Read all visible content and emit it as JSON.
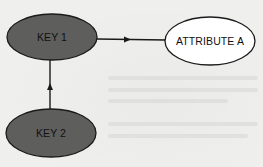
{
  "diagram": {
    "type": "entity-dependency",
    "colors": {
      "background": "#efefed",
      "key_fill": "#5e5e5c",
      "key_text": "#111111",
      "attribute_fill": "#ffffff",
      "stroke": "#1a1a1a"
    },
    "nodes": [
      {
        "id": "key1",
        "label": "KEY 1",
        "kind": "key",
        "cx": 52,
        "cy": 37,
        "rx": 45,
        "ry": 23
      },
      {
        "id": "key2",
        "label": "KEY 2",
        "kind": "key",
        "cx": 51,
        "cy": 133,
        "rx": 45,
        "ry": 24
      },
      {
        "id": "attrA",
        "label": "ATTRIBUTE A",
        "kind": "attribute",
        "cx": 210,
        "cy": 41,
        "rx": 45,
        "ry": 24
      }
    ],
    "edges": [
      {
        "from": "key1",
        "to": "attrA",
        "direction": "right"
      },
      {
        "from": "key2",
        "to": "key1",
        "direction": "up"
      }
    ]
  }
}
